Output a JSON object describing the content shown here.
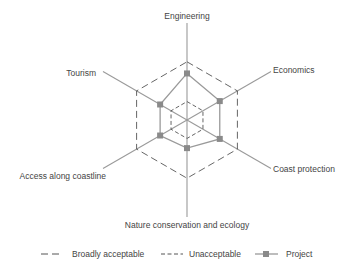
{
  "chart_data": {
    "type": "radar",
    "title": "",
    "axes": [
      "Engineering",
      "Economics",
      "Coast protection",
      "Nature conservation and ecology",
      "Access along coastline",
      "Tourism"
    ],
    "scale": [
      0,
      100
    ],
    "series": [
      {
        "name": "Broadly acceptable",
        "style": "long-dash",
        "values": [
          60,
          60,
          60,
          60,
          60,
          60
        ]
      },
      {
        "name": "Unacceptable",
        "style": "short-dash",
        "values": [
          19,
          19,
          19,
          19,
          19,
          19
        ]
      },
      {
        "name": "Project",
        "style": "solid-square-markers",
        "values": [
          48,
          39,
          39,
          29,
          32,
          32
        ]
      }
    ],
    "grid": false,
    "legend_position": "bottom"
  },
  "legend": {
    "broadly": "Broadly acceptable",
    "unacceptable": "Unacceptable",
    "project": "Project"
  },
  "colors": {
    "axis": "#9a9a9a",
    "project": "#8a8a8a",
    "dash": "#555555",
    "text": "#444444"
  }
}
